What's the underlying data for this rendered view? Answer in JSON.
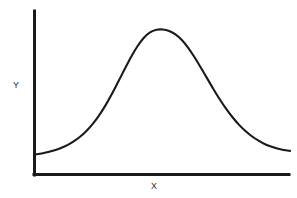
{
  "figure": {
    "background_color": "#ffffff",
    "ink_color": "#1a1a1a"
  },
  "chart_data": {
    "type": "line",
    "title": "",
    "subtitle": "",
    "xlabel": "X",
    "ylabel": "Y",
    "legend": [],
    "legend_position": "none",
    "grid": false,
    "axis_style": "open-left-bottom-spines",
    "xlim": [
      0,
      10
    ],
    "ylim": [
      0,
      1.1
    ],
    "xticks": [],
    "yticks": [],
    "xtick_labels": [],
    "ytick_labels": [],
    "annotations": [],
    "series": [
      {
        "name": "bell-curve",
        "x": [
          0.0,
          0.25,
          0.5,
          0.75,
          1.0,
          1.25,
          1.5,
          1.75,
          2.0,
          2.25,
          2.5,
          2.75,
          3.0,
          3.25,
          3.5,
          3.75,
          4.0,
          4.25,
          4.5,
          4.75,
          5.0,
          5.25,
          5.5,
          5.75,
          6.0,
          6.25,
          6.5,
          6.75,
          7.0,
          7.25,
          7.5,
          7.75,
          8.0,
          8.25,
          8.5,
          8.75,
          9.0,
          9.25,
          9.5,
          9.75,
          10.0
        ],
        "y": [
          0.135,
          0.142,
          0.152,
          0.164,
          0.18,
          0.2,
          0.226,
          0.258,
          0.298,
          0.347,
          0.406,
          0.475,
          0.553,
          0.638,
          0.724,
          0.808,
          0.882,
          0.941,
          0.98,
          0.998,
          1.0,
          0.99,
          0.966,
          0.927,
          0.873,
          0.808,
          0.735,
          0.66,
          0.585,
          0.514,
          0.449,
          0.391,
          0.34,
          0.297,
          0.261,
          0.232,
          0.208,
          0.19,
          0.176,
          0.166,
          0.16
        ]
      }
    ]
  },
  "labels": {
    "y_axis": "Y",
    "x_axis": "X"
  }
}
